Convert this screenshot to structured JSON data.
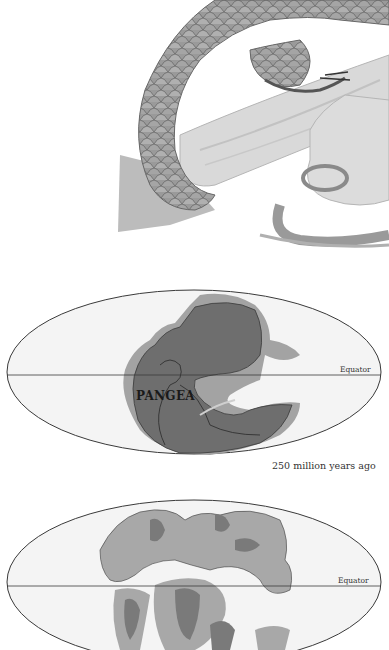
{
  "illustration": {
    "subject": "scaly reptile tail coiled around tree branch",
    "colors": {
      "scales": "#8e8e8e",
      "branch": "#d4d4d4",
      "shadow": "#a8a8a8"
    }
  },
  "map_pangea": {
    "landmass_label": "PANGEA",
    "equator_label": "Equator",
    "caption": "250 million years ago",
    "colors": {
      "land_dark": "#6e6e6e",
      "land_light": "#a3a3a3",
      "ocean": "#f4f4f4",
      "outline": "#3a3a3a"
    }
  },
  "map_later": {
    "equator_label": "Equator",
    "colors": {
      "land_dark": "#7a7a7a",
      "land_light": "#a8a8a8",
      "ocean": "#f4f4f4",
      "outline": "#3a3a3a"
    }
  }
}
